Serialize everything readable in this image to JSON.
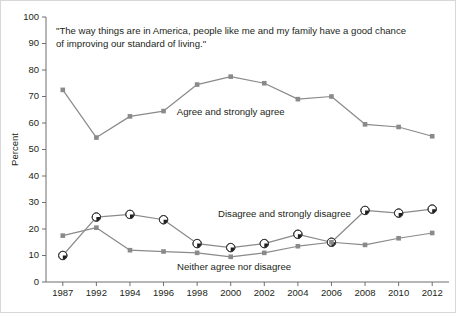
{
  "chart_data": {
    "type": "line",
    "title_line1": "\"The way things are in America, people like me and my family have a good chance",
    "title_line2": "of improving our standard of living.\"",
    "xlabel": "",
    "ylabel": "Percent",
    "ylim": [
      0,
      100
    ],
    "ytick_step": 10,
    "grid": false,
    "legend_position": "inline-annotations",
    "categories": [
      "1987",
      "1992",
      "1994",
      "1996",
      "1998",
      "2000",
      "2002",
      "2004",
      "2006",
      "2008",
      "2010",
      "2012"
    ],
    "yticks": [
      "0",
      "10",
      "20",
      "30",
      "40",
      "50",
      "60",
      "70",
      "80",
      "90",
      "100"
    ],
    "series": [
      {
        "name": "Agree and strongly agree",
        "marker": "square",
        "color": "#8a8a8a",
        "values": [
          72.5,
          54.5,
          62.5,
          64.5,
          74.5,
          77.5,
          75,
          69,
          70,
          59.5,
          58.5,
          55
        ]
      },
      {
        "name": "Disagree and strongly disagree",
        "marker": "circle-half",
        "color": "#8a8a8a",
        "values": [
          10,
          24.5,
          25.5,
          23.5,
          14.5,
          13,
          14.5,
          18,
          15,
          27,
          26,
          27.5
        ]
      },
      {
        "name": "Neither agree nor disagree",
        "marker": "square",
        "color": "#8a8a8a",
        "values": [
          17.5,
          20.5,
          12,
          11.5,
          11,
          9.5,
          11,
          13.5,
          15,
          14,
          16.5,
          18.5
        ]
      }
    ],
    "annotations": [
      {
        "text": "Agree and strongly agree",
        "x_index": 5,
        "y_value": 63
      },
      {
        "text": "Disagree and strongly disagree",
        "x_index": 6.6,
        "y_value": 24.5
      },
      {
        "text": "Neither agree nor disagree",
        "x_index": 5.1,
        "y_value": 4.5
      }
    ]
  }
}
